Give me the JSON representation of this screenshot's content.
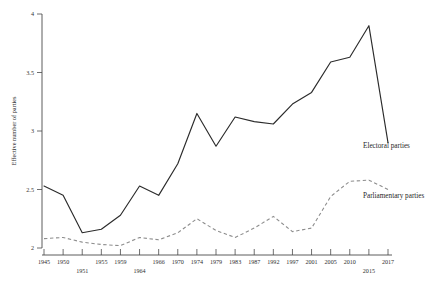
{
  "chart_data": {
    "type": "line",
    "title": "",
    "xlabel": "",
    "ylabel": "Effective number of parties",
    "ylim": [
      2,
      4
    ],
    "yticks": [
      "2",
      "2.5",
      "3",
      "3.5",
      "4"
    ],
    "ytick_values": [
      2,
      2.5,
      3,
      3.5,
      4
    ],
    "grid": false,
    "legend_position": "right-inline",
    "categories": [
      "1945",
      "1950",
      "1951",
      "1955",
      "1959",
      "1964",
      "1966",
      "1970",
      "1974",
      "1979",
      "1983",
      "1987",
      "1992",
      "1997",
      "2001",
      "2005",
      "2010",
      "2015",
      "2017"
    ],
    "series": [
      {
        "name": "Electoral parties",
        "style": "solid",
        "color": "#2b2b2b",
        "values": [
          2.53,
          2.45,
          2.13,
          2.16,
          2.28,
          2.53,
          2.45,
          2.72,
          3.15,
          2.87,
          3.12,
          3.08,
          3.06,
          3.23,
          3.33,
          3.59,
          3.63,
          3.9,
          2.9
        ]
      },
      {
        "name": "Parliamentary parties",
        "style": "dashed",
        "color": "#8d8d8d",
        "values": [
          2.08,
          2.09,
          2.05,
          2.03,
          2.02,
          2.09,
          2.07,
          2.13,
          2.25,
          2.15,
          2.09,
          2.17,
          2.27,
          2.14,
          2.17,
          2.44,
          2.57,
          2.58,
          2.5
        ]
      }
    ],
    "annotations": [
      {
        "text": "Electoral parties",
        "target_series": "Electoral parties"
      },
      {
        "text": "Parliamentary parties",
        "target_series": "Parliamentary parties"
      }
    ]
  },
  "xaxis": {
    "ticks": [
      {
        "label": "1945",
        "row": 0
      },
      {
        "label": "1950",
        "row": 0
      },
      {
        "label": "1951",
        "row": 1
      },
      {
        "label": "1955",
        "row": 0
      },
      {
        "label": "1959",
        "row": 0
      },
      {
        "label": "1964",
        "row": 1
      },
      {
        "label": "1966",
        "row": 0
      },
      {
        "label": "1970",
        "row": 0
      },
      {
        "label": "1974",
        "row": 0
      },
      {
        "label": "1979",
        "row": 0
      },
      {
        "label": "1983",
        "row": 0
      },
      {
        "label": "1987",
        "row": 0
      },
      {
        "label": "1992",
        "row": 0
      },
      {
        "label": "1997",
        "row": 0
      },
      {
        "label": "2001",
        "row": 0
      },
      {
        "label": "2005",
        "row": 0
      },
      {
        "label": "2010",
        "row": 0
      },
      {
        "label": "2015",
        "row": 1
      },
      {
        "label": "2017",
        "row": 0
      }
    ]
  }
}
